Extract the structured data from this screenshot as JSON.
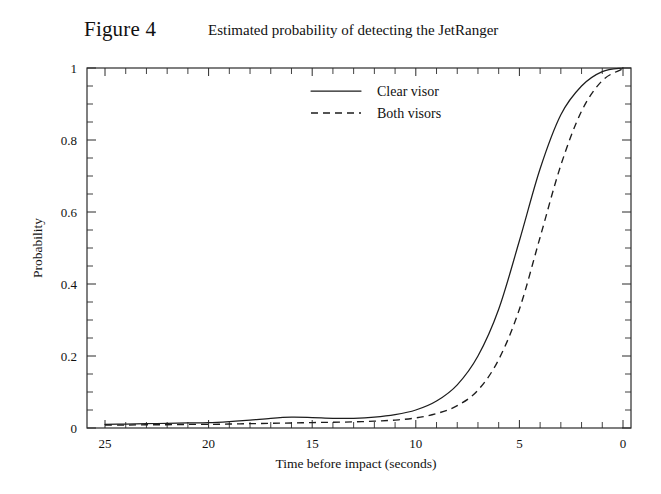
{
  "figure": {
    "label": "Figure 4",
    "subtitle": "Estimated probability of detecting the JetRanger"
  },
  "chart_data": {
    "type": "line",
    "title": "Estimated probability of detecting the JetRanger",
    "xlabel": "Time before impact  (seconds)",
    "ylabel": "Probability",
    "xlim": [
      25,
      0
    ],
    "ylim": [
      0,
      1
    ],
    "x_reversed": true,
    "grid": false,
    "legend_position": "upper-center",
    "x_ticks": [
      25,
      20,
      15,
      10,
      5,
      0
    ],
    "x_tick_labels": [
      "25",
      "20",
      "15",
      "10",
      "5",
      "0"
    ],
    "x_minor_tick_step": 1,
    "y_ticks": [
      0,
      0.2,
      0.4,
      0.6,
      0.8,
      1
    ],
    "y_tick_labels": [
      "0",
      "0.2",
      "0.4",
      "0.6",
      "0.8",
      "1"
    ],
    "y_minor_tick_step": 0.05,
    "x": [
      25,
      24,
      23,
      22,
      21,
      20,
      19,
      18,
      17,
      16,
      15,
      14,
      13,
      12,
      11,
      10,
      9,
      8,
      7,
      6,
      5,
      4,
      3,
      2,
      1,
      0
    ],
    "series": [
      {
        "name": "Clear visor",
        "style": "solid",
        "values": [
          0.01,
          0.011,
          0.012,
          0.013,
          0.014,
          0.015,
          0.018,
          0.022,
          0.027,
          0.03,
          0.029,
          0.027,
          0.027,
          0.03,
          0.037,
          0.05,
          0.075,
          0.12,
          0.2,
          0.33,
          0.52,
          0.72,
          0.87,
          0.95,
          0.99,
          1.0
        ]
      },
      {
        "name": "Both visors",
        "style": "dashed",
        "values": [
          0.008,
          0.008,
          0.009,
          0.009,
          0.01,
          0.01,
          0.011,
          0.012,
          0.013,
          0.014,
          0.015,
          0.016,
          0.017,
          0.019,
          0.022,
          0.028,
          0.04,
          0.062,
          0.105,
          0.19,
          0.33,
          0.53,
          0.73,
          0.88,
          0.965,
          0.998
        ]
      }
    ]
  },
  "legend": {
    "items": [
      {
        "label": "Clear visor",
        "style": "solid"
      },
      {
        "label": "Both visors",
        "style": "dashed"
      }
    ]
  },
  "colors": {
    "background": "#ffffff",
    "ink": "#1d1d1d",
    "axis": "#2b2b2b"
  }
}
